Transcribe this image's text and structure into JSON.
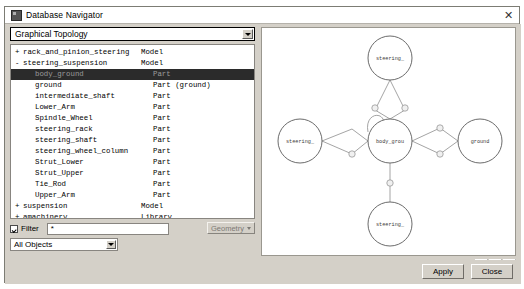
{
  "window": {
    "title": "Database Navigator",
    "icon": "app-icon",
    "close_label": "✕"
  },
  "view_selector": {
    "value": "Graphical Topology",
    "caret": "chevron-down-icon"
  },
  "tree": {
    "columns": [
      "Name",
      "Type"
    ],
    "rows": [
      {
        "expander": "+",
        "indent": 1,
        "name": "rack_and_pinion_steering",
        "type": "Model",
        "selected": false
      },
      {
        "expander": "-",
        "indent": 1,
        "name": "steering_suspension",
        "type": "Model",
        "selected": false
      },
      {
        "expander": "",
        "indent": 2,
        "name": "body_ground",
        "type": "Part",
        "selected": true
      },
      {
        "expander": "",
        "indent": 2,
        "name": "ground",
        "type": "Part (ground)",
        "selected": false
      },
      {
        "expander": "",
        "indent": 2,
        "name": "intermediate_shaft",
        "type": "Part",
        "selected": false
      },
      {
        "expander": "",
        "indent": 2,
        "name": "Lower_Arm",
        "type": "Part",
        "selected": false
      },
      {
        "expander": "",
        "indent": 2,
        "name": "Spindle_Wheel",
        "type": "Part",
        "selected": false
      },
      {
        "expander": "",
        "indent": 2,
        "name": "steering_rack",
        "type": "Part",
        "selected": false
      },
      {
        "expander": "",
        "indent": 2,
        "name": "steering_shaft",
        "type": "Part",
        "selected": false
      },
      {
        "expander": "",
        "indent": 2,
        "name": "steering_wheel_column",
        "type": "Part",
        "selected": false
      },
      {
        "expander": "",
        "indent": 2,
        "name": "Strut_Lower",
        "type": "Part",
        "selected": false
      },
      {
        "expander": "",
        "indent": 2,
        "name": "Strut_Upper",
        "type": "Part",
        "selected": false
      },
      {
        "expander": "",
        "indent": 2,
        "name": "Tie_Rod",
        "type": "Part",
        "selected": false
      },
      {
        "expander": "",
        "indent": 2,
        "name": "Upper_Arm",
        "type": "Part",
        "selected": false
      },
      {
        "expander": "+",
        "indent": 1,
        "name": "suspension",
        "type": "Model",
        "selected": false
      },
      {
        "expander": "+",
        "indent": 1,
        "name": "amachinery",
        "type": "Library",
        "selected": false
      },
      {
        "expander": "+",
        "indent": 1,
        "name": "MDI",
        "type": "Library",
        "selected": false
      }
    ]
  },
  "filter": {
    "checkbox_label": "Filter",
    "checked": true,
    "value": "*",
    "placeholder": "",
    "type_selector": "Geometry"
  },
  "objects_selector": {
    "value": "All Objects"
  },
  "sort": {
    "label": "Sort by",
    "value": "Type",
    "highlight_label": "Highlight",
    "highlight_checked": false,
    "zoom_buttons": [
      "+",
      "-",
      "–"
    ]
  },
  "graph": {
    "nodes": [
      {
        "id": "n-top",
        "label": "steering_",
        "cx": 128,
        "cy": 30,
        "r": 22
      },
      {
        "id": "n-left",
        "label": "steering_",
        "cx": 38,
        "cy": 113,
        "r": 22
      },
      {
        "id": "n-center",
        "label": "body_grou",
        "cx": 128,
        "cy": 113,
        "r": 22
      },
      {
        "id": "n-right",
        "label": "ground",
        "cx": 218,
        "cy": 113,
        "r": 22
      },
      {
        "id": "n-bottom",
        "label": "steering_",
        "cx": 128,
        "cy": 196,
        "r": 22
      }
    ],
    "edge_markers": 7,
    "self_loop": true
  },
  "footer": {
    "apply_label": "Apply",
    "close_label": "Close"
  },
  "colors": {
    "dialog_bg": "#d4d0c8",
    "panel_bg": "#ffffff",
    "selection_bg": "#2b2b2b",
    "selection_fg": "#9b9b9b",
    "border": "#888580",
    "node_stroke": "#5a5a5a"
  }
}
